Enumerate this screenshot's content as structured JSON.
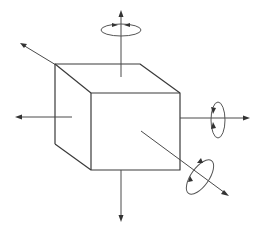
{
  "diagram": {
    "colors": {
      "line": "#3a3a3a",
      "background": "#ffffff"
    },
    "cube": {
      "front_face": [
        [
          91,
          93
        ],
        [
          180,
          93
        ],
        [
          180,
          170
        ],
        [
          91,
          170
        ]
      ],
      "back_offset": [
        -36,
        -29
      ]
    },
    "axes": [
      {
        "name": "up",
        "from": [
          121,
          77
        ],
        "to": [
          121,
          10
        ],
        "rotation": true
      },
      {
        "name": "down",
        "from": [
          121,
          170
        ],
        "to": [
          121,
          222
        ],
        "rotation": false
      },
      {
        "name": "left",
        "from": [
          72,
          117
        ],
        "to": [
          15,
          117
        ],
        "rotation": false
      },
      {
        "name": "right",
        "from": [
          180,
          118
        ],
        "to": [
          250,
          118
        ],
        "rotation": true
      },
      {
        "name": "back-left",
        "from": [
          55,
          64
        ],
        "to": [
          20,
          43
        ],
        "rotation": false
      },
      {
        "name": "front-diagonal",
        "from": [
          141,
          131
        ],
        "to": [
          228,
          195
        ],
        "rotation": true
      }
    ]
  }
}
